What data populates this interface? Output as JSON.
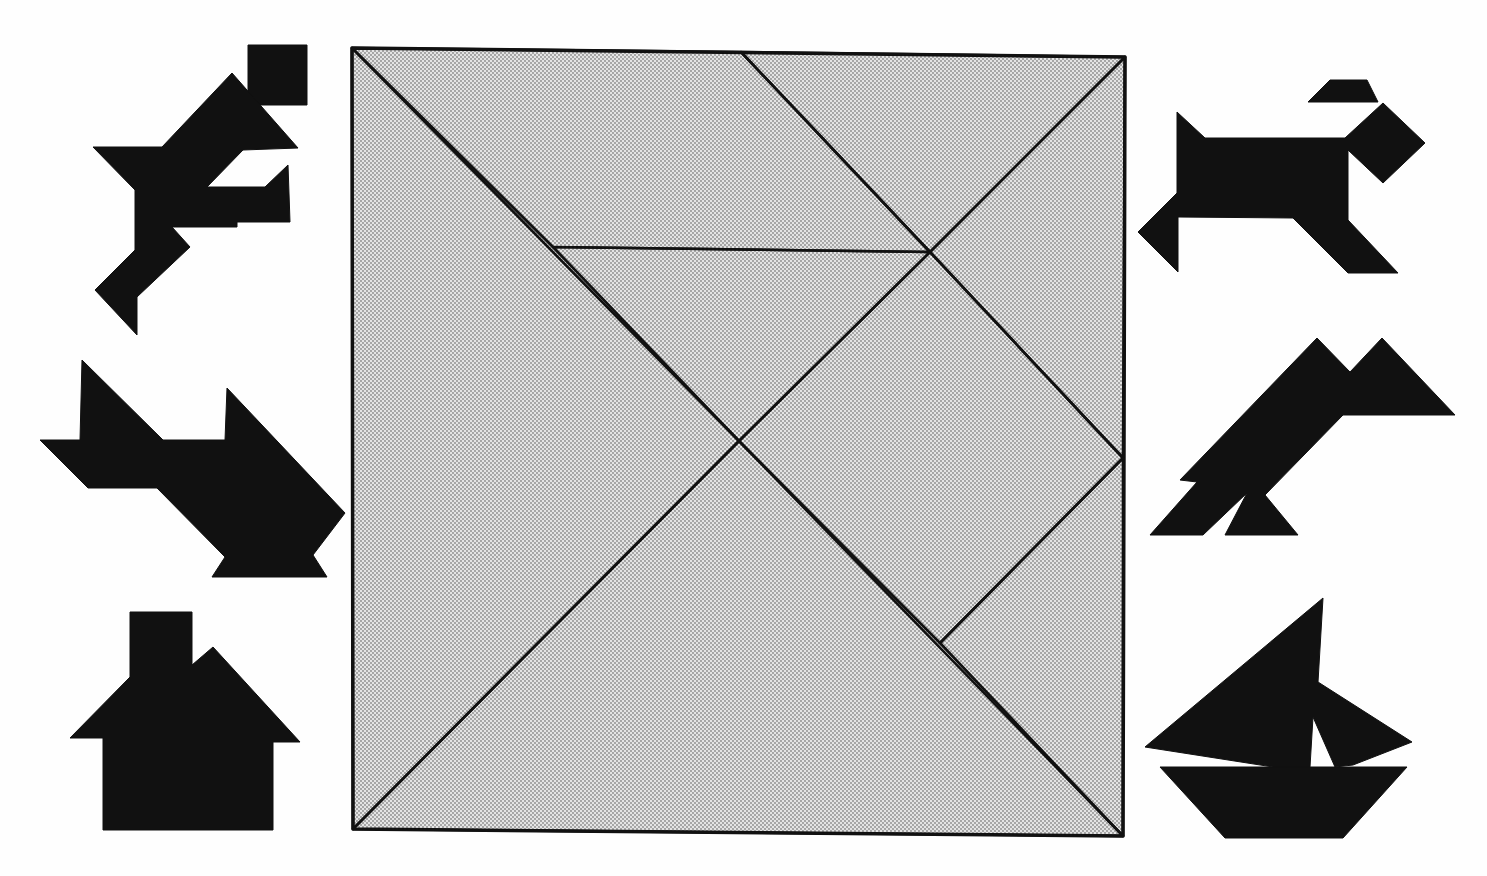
{
  "page": {
    "title_clipped": "",
    "background": "#ffffff"
  },
  "tangram_square": {
    "label": "Tangram square",
    "fill": "#dcdcdc",
    "dot_color": "#8a8a8a",
    "line_color": "#111111",
    "corners": {
      "top_left": [
        352,
        48
      ],
      "top_right": [
        1125,
        57
      ],
      "bottom_right": [
        1123,
        836
      ],
      "bottom_left": [
        353,
        829
      ]
    },
    "pieces": [
      {
        "name": "large-triangle-left",
        "points": "352,48 739,441 353,829"
      },
      {
        "name": "large-triangle-bottom",
        "points": "353,829 739,441 1123,836"
      },
      {
        "name": "medium-triangle-top-right",
        "points": "741,52 1125,57 930,252"
      },
      {
        "name": "parallelogram-top",
        "points": "352,48 741,52 930,252 553,247"
      },
      {
        "name": "small-triangle-center",
        "points": "553,247 930,252 739,441"
      },
      {
        "name": "square-right",
        "points": "930,252 1123,458 940,643 739,441"
      },
      {
        "name": "small-triangle-right",
        "points": "1123,458 1123,836 940,643"
      },
      {
        "name": "right-top-triangle",
        "points": "930,252 1125,57 1123,458"
      }
    ]
  },
  "silhouettes": {
    "fill": "#111111",
    "items": [
      {
        "name": "running-man",
        "label": "Running man",
        "shapes": [
          "248,45 307,45 307,105 248,105",
          "232,73 298,148 243,150 207,187 265,187 288,165 290,222 237,222 237,227 172,227 190,247 137,297 137,335 95,290 135,250 135,190 93,147 162,147"
        ]
      },
      {
        "name": "airplane",
        "label": "Airplane",
        "shapes": [
          "82,360 163,440 225,440 227,388 345,513 313,555 327,577 212,577 225,557 157,488 88,488 40,440 80,440"
        ]
      },
      {
        "name": "house",
        "label": "House",
        "shapes": [
          "130,612 192,612 192,665 213,647 300,742 273,742 273,830 103,830 103,738 70,738 130,677"
        ]
      },
      {
        "name": "dog",
        "label": "Dog",
        "shapes": [
          "1177,112 1205,138 1345,138 1383,103 1425,143 1383,183 1348,150 1348,220 1398,273 1348,273 1293,218 1178,217 1178,272 1138,232 1177,193",
          "1308,102 1330,80 1367,80 1378,102"
        ]
      },
      {
        "name": "bird",
        "label": "Bird",
        "shapes": [
          "1317,338 1350,372 1382,338 1455,415 1343,415 1265,495 1298,535 1225,535 1247,493 1203,535 1150,535 1197,482 1180,480"
        ]
      },
      {
        "name": "sailboat",
        "label": "Sailboat",
        "shapes": [
          "1323,598 1318,682 1412,742 1353,765 1335,767 1313,717 1310,767 1273,767 1145,747",
          "1160,767 1407,767 1343,838 1225,838"
        ]
      }
    ]
  }
}
